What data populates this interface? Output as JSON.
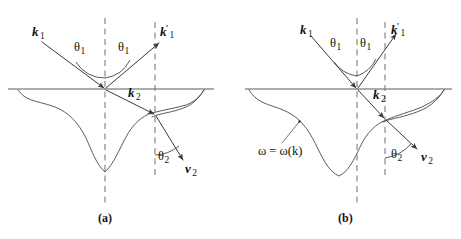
{
  "figure": {
    "background_color": "#ffffff",
    "curve_color": "#4a4a4a",
    "axis_color": "#5a5a5a",
    "dash_color": "#7d7d7d",
    "vector_color": "#3a3a3a",
    "text_color": "#111111"
  },
  "panels": [
    {
      "id": "a",
      "caption": "(a)",
      "caption_pos": {
        "x": 98,
        "y": 214
      },
      "interface_y": 89,
      "labels": {
        "k1": {
          "base": "k",
          "sub": "1",
          "prime": "",
          "x": 32,
          "y": 32
        },
        "k1_prime": {
          "base": "k",
          "sub": "1",
          "prime": "'",
          "x": 160,
          "y": 30
        },
        "k2": {
          "base": "k",
          "sub": "2",
          "prime": "",
          "x": 128,
          "y": 93
        },
        "v2": {
          "base": "v",
          "sub": "2",
          "prime": "",
          "x": 185,
          "y": 169
        },
        "theta1_left": {
          "base": "θ",
          "sub": "1",
          "x": 74,
          "y": 41
        },
        "theta1_right": {
          "base": "θ",
          "sub": "1",
          "x": 118,
          "y": 41
        },
        "theta2": {
          "base": "θ",
          "sub": "2",
          "x": 158,
          "y": 148
        }
      },
      "geometry": {
        "origin": {
          "x": 105,
          "y": 89
        },
        "refract_point": {
          "x": 155,
          "y": 115
        },
        "dash_line_1_x": 105,
        "dash_line_2_x": 155,
        "interface_x_start": 8,
        "interface_x_end": 214,
        "incident_start": {
          "x": 42,
          "y": 42
        },
        "reflected_end": {
          "x": 160,
          "y": 42
        },
        "group_velocity_end": {
          "x": 184,
          "y": 161
        },
        "curve_min_y": 173
      }
    },
    {
      "id": "b",
      "caption": "(b)",
      "caption_pos": {
        "x": 338,
        "y": 214
      },
      "interface_y": 89,
      "labels": {
        "k1": {
          "base": "k",
          "sub": "1",
          "prime": "",
          "x": 300,
          "y": 30
        },
        "k1_prime": {
          "base": "k",
          "sub": "1",
          "prime": "'",
          "x": 391,
          "y": 28
        },
        "k2": {
          "base": "k",
          "sub": "2",
          "prime": "",
          "x": 373,
          "y": 95
        },
        "v2": {
          "base": "v",
          "sub": "2",
          "prime": "",
          "x": 421,
          "y": 157
        },
        "theta1_left": {
          "base": "θ",
          "sub": "1",
          "x": 330,
          "y": 37
        },
        "theta1_right": {
          "base": "θ",
          "sub": "1",
          "x": 357,
          "y": 37
        },
        "theta2": {
          "base": "θ",
          "sub": "2",
          "x": 391,
          "y": 155
        },
        "dispersion": {
          "text": "ω = ω(k)",
          "x": 258,
          "y": 150
        }
      },
      "geometry": {
        "origin": {
          "x": 357,
          "y": 89
        },
        "refract_point": {
          "x": 385,
          "y": 119
        },
        "dash_line_1_x": 357,
        "dash_line_2_x": 385,
        "interface_x_start": 245,
        "interface_x_end": 452,
        "incident_start": {
          "x": 311,
          "y": 36
        },
        "reflected_end": {
          "x": 397,
          "y": 33
        },
        "group_velocity_end": {
          "x": 418,
          "y": 150
        },
        "curve_min_y": 176,
        "leader_from": {
          "x": 282,
          "y": 143
        },
        "leader_to": {
          "x": 299,
          "y": 122
        }
      }
    }
  ]
}
